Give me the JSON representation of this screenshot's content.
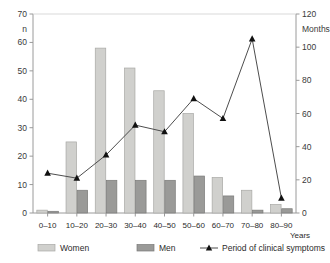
{
  "chart_data": {
    "type": "bar",
    "title": "",
    "subtitle": "",
    "categories": [
      "0–10",
      "10–20",
      "20–30",
      "30–40",
      "40–50",
      "50–60",
      "60–70",
      "70–80",
      "80–90"
    ],
    "xlabel": "Years",
    "ylabel": "n",
    "ylim": [
      0,
      70
    ],
    "yticks": [
      0,
      10,
      20,
      30,
      40,
      50,
      60,
      70
    ],
    "y2label": "Months",
    "y2lim": [
      0,
      120
    ],
    "y2ticks": [
      0,
      20,
      40,
      60,
      80,
      100,
      120
    ],
    "grid": false,
    "legend_position": "bottom",
    "series": [
      {
        "name": "Women",
        "type": "bar",
        "axis": "left",
        "color": "#d0d0cd",
        "values": [
          1,
          25,
          58,
          51,
          43,
          35,
          12.5,
          8,
          3
        ]
      },
      {
        "name": "Men",
        "type": "bar",
        "axis": "left",
        "color": "#9a9a98",
        "values": [
          0.6,
          8,
          11.5,
          11.5,
          11.5,
          13,
          6,
          1,
          1.5
        ]
      },
      {
        "name": "Period of clinical symptoms",
        "type": "line",
        "axis": "right",
        "color": "#555555",
        "marker": "triangle",
        "values": [
          24,
          21,
          35,
          53,
          49,
          69,
          57,
          105,
          9
        ]
      }
    ]
  },
  "legend": {
    "items": [
      {
        "label": "Women",
        "swatch": "bar-light",
        "icon": "legend-swatch-icon"
      },
      {
        "label": "Men",
        "swatch": "bar-dark",
        "icon": "legend-swatch-icon"
      },
      {
        "label": "Period of clinical symptoms",
        "swatch": "line-marker",
        "icon": "legend-line-marker-icon"
      }
    ]
  },
  "colors": {
    "women_bar": "#d0d0cd",
    "women_bar_edge": "#a8a8a5",
    "men_bar": "#9a9a98",
    "men_bar_edge": "#7a7a78",
    "line": "#4d4d4d",
    "marker": "#111111",
    "axis": "#9a9a9a",
    "text": "#2b2b2b",
    "background": "#ffffff"
  }
}
